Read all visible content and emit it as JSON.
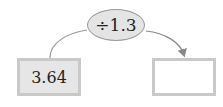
{
  "operation": {
    "label": "÷1.3"
  },
  "input_box": {
    "value": "3.64"
  },
  "output_box": {
    "value": ""
  },
  "colors": {
    "ellipse_fill": "#e4e4e4",
    "box_fill": "#e6e6e6",
    "border": "#c9c9c9",
    "line": "#888888"
  }
}
